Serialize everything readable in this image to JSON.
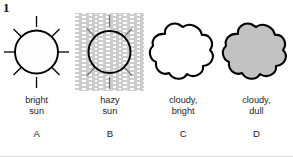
{
  "figure": {
    "number": "1"
  },
  "panels": [
    {
      "id": "bright-sun",
      "icon": "sun-icon",
      "caption": "bright\nsun",
      "letter": "A",
      "fill": "#fdfdfd",
      "stroke": "#000000",
      "haze": false
    },
    {
      "id": "hazy-sun",
      "icon": "hazy-sun-icon",
      "caption": "hazy\nsun",
      "letter": "B",
      "fill": "#ffffff",
      "stroke": "#000000",
      "haze": true,
      "haze_color": "#9a9a9a"
    },
    {
      "id": "cloudy-bright",
      "icon": "cloud-icon",
      "caption": "cloudy,\nbright",
      "letter": "C",
      "fill": "#ffffff",
      "stroke": "#000000",
      "haze": false
    },
    {
      "id": "cloudy-dull",
      "icon": "cloud-filled-icon",
      "caption": "cloudy,\ndull",
      "letter": "D",
      "fill": "#c2c2c2",
      "stroke": "#000000",
      "haze": false
    }
  ]
}
